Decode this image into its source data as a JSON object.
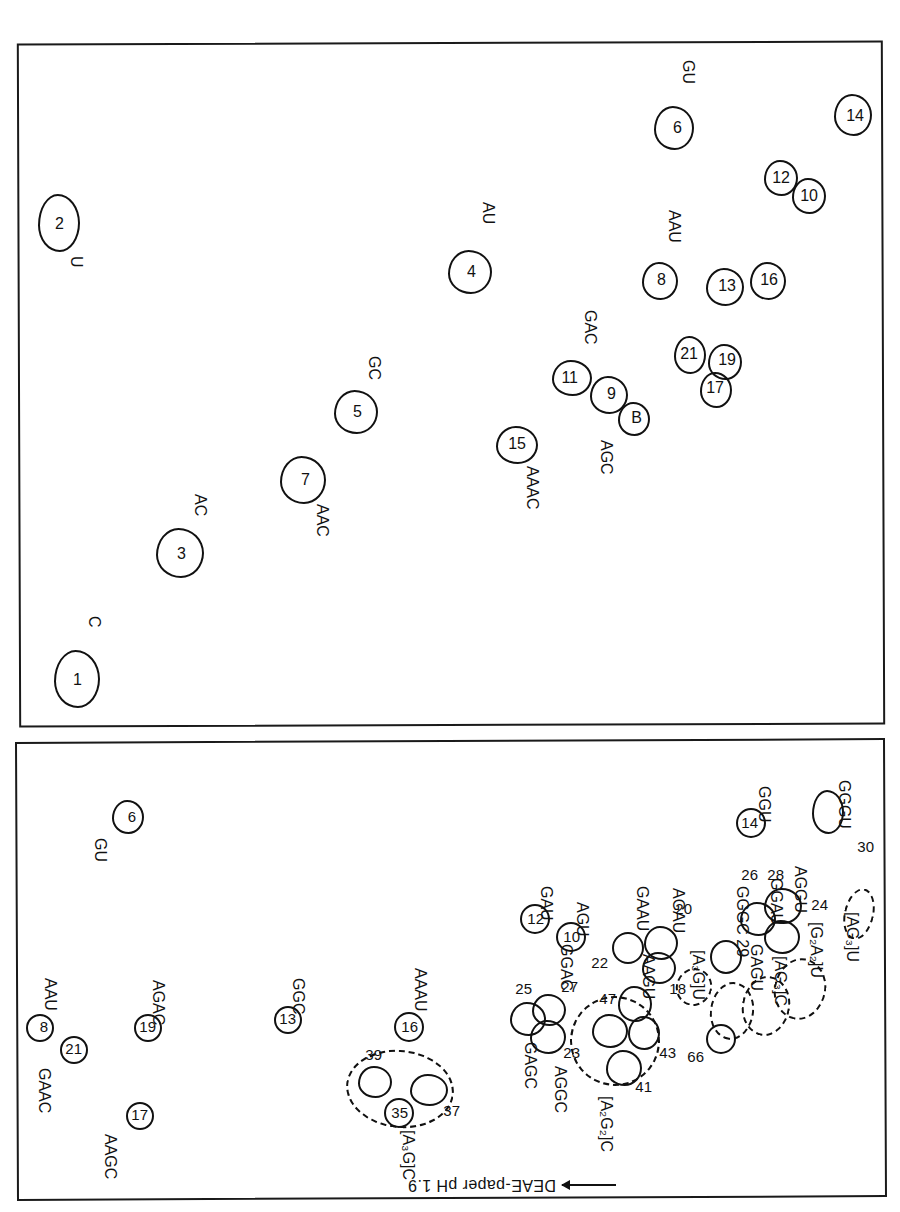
{
  "figure": {
    "kind": "two-dimensional RNA oligonucleotide fingerprint map",
    "axis_label": "DEAE-paper pH 1.9",
    "axis_arrow": "arrow-left"
  },
  "panel_top": {
    "name": "upper-fingerprint-panel",
    "spots": [
      {
        "id": "30",
        "label": "GGGU",
        "x": 56,
        "y": 378,
        "w": 32,
        "h": 42,
        "style": "solid",
        "num_dx": 9,
        "num_dy": 10,
        "lab_x": 14,
        "lab_y": 430,
        "lab_rot": "vert",
        "num_outside": true,
        "nx": 22,
        "ny": 355
      },
      {
        "id": "24",
        "label": "",
        "x": 30,
        "y": 272,
        "w": 34,
        "h": 52,
        "style": "dashed",
        "nx": 70,
        "ny": 300
      },
      {
        "id": "",
        "label": "[AG3]U",
        "bracket": "[AG₃]U",
        "x": 78,
        "y": 196,
        "w": 52,
        "h": 58,
        "style": "dashed",
        "lab_x": 36,
        "lab_y": 268,
        "lab_rot": "vert"
      },
      {
        "id": "",
        "label": "[G2A2]U",
        "bracket": "[G₂A₂]U",
        "x": 108,
        "y": 176,
        "w": 52,
        "h": 58,
        "style": "dashed",
        "lab_x": 70,
        "lab_y": 268,
        "lab_rot": "vert"
      },
      {
        "id": "",
        "label": "[AG3]C",
        "bracket": "[AG₃]C",
        "x": 142,
        "y": 176,
        "w": 46,
        "h": 56,
        "style": "dashed",
        "lab_x": 104,
        "lab_y": 258,
        "lab_rot": "vert"
      },
      {
        "id": "28",
        "label": "GGAU",
        "x": 98,
        "y": 288,
        "w": 36,
        "h": 34,
        "style": "solid"
      },
      {
        "id": "26",
        "label": "GAGU",
        "x": 120,
        "y": 282,
        "w": 34,
        "h": 34,
        "style": "solid"
      },
      {
        "id": "",
        "label": "AGGU",
        "x": 100,
        "y": 262,
        "w": 34,
        "h": 32,
        "style": "solid"
      },
      {
        "id": "29",
        "label": "GGGC",
        "x": 158,
        "y": 240,
        "w": 32,
        "h": 32,
        "style": "round"
      },
      {
        "id": "14",
        "label": "GGU",
        "x": 136,
        "y": 376,
        "w": 30,
        "h": 30,
        "style": "circ"
      },
      {
        "id": "66",
        "label": "",
        "x": 164,
        "y": 160,
        "w": 30,
        "h": 30,
        "style": "round"
      },
      {
        "id": "",
        "label": "[A3G]U",
        "bracket": "[A₃G]U",
        "x": 186,
        "y": 212,
        "w": 34,
        "h": 34,
        "style": "dashed"
      },
      {
        "id": "20",
        "label": "AGAU",
        "x": 222,
        "y": 254,
        "w": 32,
        "h": 34,
        "style": "solid"
      },
      {
        "id": "18",
        "label": "",
        "x": 224,
        "y": 232,
        "w": 32,
        "h": 32,
        "style": "solid"
      },
      {
        "id": "22",
        "label": "GAAU",
        "x": 258,
        "y": 250,
        "w": 32,
        "h": 32,
        "style": "round"
      },
      {
        "id": "",
        "label": "AAGU",
        "x": 246,
        "y": 196,
        "w": 34,
        "h": 34,
        "style": "solid"
      },
      {
        "id": "43",
        "label": "",
        "x": 240,
        "y": 166,
        "w": 32,
        "h": 34,
        "style": "solid"
      },
      {
        "id": "41",
        "label": "",
        "x": 258,
        "y": 128,
        "w": 34,
        "h": 34,
        "style": "solid"
      },
      {
        "id": "47",
        "label": "",
        "x": 272,
        "y": 168,
        "w": 34,
        "h": 34,
        "style": "solid"
      },
      {
        "id": "",
        "label": "[A2G2]C",
        "bracket": "[A₂G₂]C",
        "lab_x": 238,
        "lab_y": 150,
        "lab_rot": "vert"
      },
      {
        "id": "23",
        "label": "AGGC",
        "x": 334,
        "y": 162,
        "w": 34,
        "h": 34,
        "style": "solid"
      },
      {
        "id": "25",
        "label": "GAGC",
        "x": 352,
        "y": 180,
        "w": 34,
        "h": 34,
        "style": "solid"
      },
      {
        "id": "27",
        "label": "GGAC",
        "x": 336,
        "y": 188,
        "w": 32,
        "h": 32,
        "style": "solid"
      },
      {
        "id": "10",
        "label": "AGU",
        "x": 314,
        "y": 262,
        "w": 30,
        "h": 30,
        "style": "circ"
      },
      {
        "id": "12",
        "label": "GAU",
        "x": 350,
        "y": 280,
        "w": 30,
        "h": 30,
        "style": "circ"
      },
      {
        "id": "37",
        "label": "",
        "x": 452,
        "y": 108,
        "w": 36,
        "h": 32,
        "style": "solid"
      },
      {
        "id": "35",
        "label": "[A3G]C",
        "bracket": "[A₃G]C",
        "x": 486,
        "y": 88,
        "w": 28,
        "h": 28,
        "style": "circ"
      },
      {
        "id": "39",
        "label": "",
        "x": 508,
        "y": 116,
        "w": 32,
        "h": 30,
        "style": "solid"
      },
      {
        "id": "16",
        "label": "AAAU",
        "x": 476,
        "y": 172,
        "w": 30,
        "h": 30,
        "style": "circ"
      },
      {
        "id": "13",
        "label": "GGC",
        "x": 598,
        "y": 180,
        "w": 28,
        "h": 28,
        "style": "circ"
      },
      {
        "id": "19",
        "label": "AGAC",
        "x": 738,
        "y": 172,
        "w": 28,
        "h": 28,
        "style": "circ"
      },
      {
        "id": "17",
        "label": "AAGC",
        "x": 746,
        "y": 84,
        "w": 28,
        "h": 28,
        "style": "circ"
      },
      {
        "id": "21",
        "label": "GAAC",
        "x": 812,
        "y": 150,
        "w": 28,
        "h": 28,
        "style": "circ"
      },
      {
        "id": "8",
        "label": "AAU",
        "x": 846,
        "y": 172,
        "w": 28,
        "h": 28,
        "style": "circ"
      },
      {
        "id": "6",
        "label": "GU",
        "x": 758,
        "y": 380,
        "w": 30,
        "h": 32,
        "style": "solid"
      }
    ],
    "bracket_labels": [
      "[AG₃]U",
      "[G₂A₂]U",
      "[AG₃]C",
      "[A₃G]U",
      "[A₂G₂]C",
      "[A₃G]C"
    ],
    "sequence_labels": [
      "GGGU",
      "AGGU",
      "GGAU",
      "GAGU",
      "GGGC",
      "GGU",
      "AGAU",
      "GAAU",
      "AAGU",
      "AGGC",
      "GGAC",
      "GAGC",
      "AGU",
      "GAU",
      "AAAU",
      "GGC",
      "AGAC",
      "AAGC",
      "GAAC",
      "AAU",
      "GU"
    ],
    "spot_numbers": [
      "30",
      "24",
      "28",
      "26",
      "29",
      "14",
      "66",
      "20",
      "18",
      "22",
      "43",
      "41",
      "47",
      "23",
      "25",
      "27",
      "10",
      "12",
      "37",
      "35",
      "39",
      "16",
      "13",
      "19",
      "17",
      "21",
      "8",
      "6"
    ]
  },
  "panel_bottom": {
    "name": "lower-fingerprint-panel",
    "spots": [
      {
        "id": "14",
        "label": "",
        "x": 28,
        "y": 1078,
        "w": 36,
        "h": 40,
        "style": "solid"
      },
      {
        "id": "10",
        "label": "",
        "x": 74,
        "y": 1000,
        "w": 32,
        "h": 34,
        "style": "solid"
      },
      {
        "id": "12",
        "label": "",
        "x": 102,
        "y": 1018,
        "w": 32,
        "h": 34,
        "style": "solid"
      },
      {
        "id": "6",
        "label": "GU",
        "x": 206,
        "y": 1064,
        "w": 38,
        "h": 42,
        "style": "solid"
      },
      {
        "id": "16",
        "label": "",
        "x": 114,
        "y": 914,
        "w": 34,
        "h": 36,
        "style": "solid"
      },
      {
        "id": "13",
        "label": "",
        "x": 156,
        "y": 908,
        "w": 36,
        "h": 36,
        "style": "solid"
      },
      {
        "id": "8",
        "label": "AAU",
        "x": 222,
        "y": 914,
        "w": 34,
        "h": 36,
        "style": "solid"
      },
      {
        "id": "17",
        "label": "",
        "x": 168,
        "y": 806,
        "w": 30,
        "h": 34,
        "style": "solid"
      },
      {
        "id": "19",
        "label": "",
        "x": 160,
        "y": 834,
        "w": 32,
        "h": 34,
        "style": "solid"
      },
      {
        "id": "21",
        "label": "",
        "x": 196,
        "y": 840,
        "w": 30,
        "h": 34,
        "style": "solid"
      },
      {
        "id": "B",
        "label": "AGC",
        "x": 250,
        "y": 778,
        "w": 30,
        "h": 32,
        "style": "solid"
      },
      {
        "id": "9",
        "label": "",
        "x": 274,
        "y": 800,
        "w": 36,
        "h": 36,
        "style": "solid"
      },
      {
        "id": "11",
        "label": "GAC",
        "x": 310,
        "y": 818,
        "w": 38,
        "h": 34,
        "style": "solid"
      },
      {
        "id": "15",
        "label": "AAAC",
        "x": 364,
        "y": 750,
        "w": 40,
        "h": 36,
        "style": "solid"
      },
      {
        "id": "4",
        "label": "AU",
        "x": 410,
        "y": 920,
        "w": 42,
        "h": 42,
        "style": "solid"
      },
      {
        "id": "5",
        "label": "GC",
        "x": 524,
        "y": 780,
        "w": 42,
        "h": 42,
        "style": "solid"
      },
      {
        "id": "7",
        "label": "AAC",
        "x": 576,
        "y": 710,
        "w": 44,
        "h": 46,
        "style": "solid"
      },
      {
        "id": "3",
        "label": "AC",
        "x": 698,
        "y": 636,
        "w": 46,
        "h": 48,
        "style": "solid"
      },
      {
        "id": "1",
        "label": "C",
        "x": 802,
        "y": 506,
        "w": 44,
        "h": 56,
        "style": "solid"
      },
      {
        "id": "2",
        "label": "U",
        "x": 822,
        "y": 962,
        "w": 40,
        "h": 56,
        "style": "solid"
      }
    ],
    "sequence_labels": [
      "GU",
      "AAU",
      "AGC",
      "GAC",
      "AAAC",
      "AU",
      "GC",
      "AAC",
      "AC",
      "C",
      "U"
    ],
    "spot_numbers": [
      "14",
      "10",
      "12",
      "6",
      "16",
      "13",
      "8",
      "17",
      "19",
      "21",
      "B",
      "9",
      "11",
      "15",
      "4",
      "5",
      "7",
      "3",
      "1",
      "2"
    ]
  }
}
